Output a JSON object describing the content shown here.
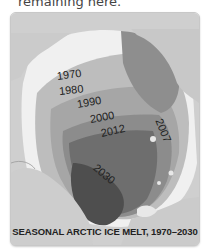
{
  "caption_top": "remaining here.",
  "map": {
    "title": "SEASONAL ARCTIC ICE MELT, 1970–2030",
    "style": "grayscale",
    "labels": [
      {
        "year": "1970",
        "x": 42,
        "y": 72,
        "rotate": -8
      },
      {
        "year": "1980",
        "x": 46,
        "y": 88,
        "rotate": -6
      },
      {
        "year": "1990",
        "x": 66,
        "y": 103,
        "rotate": -10
      },
      {
        "year": "2000",
        "x": 78,
        "y": 118,
        "rotate": -10
      },
      {
        "year": "2012",
        "x": 88,
        "y": 134,
        "rotate": -12
      },
      {
        "year": "2007",
        "x": 148,
        "y": 112,
        "rotate": 68
      },
      {
        "year": "2030",
        "x": 84,
        "y": 162,
        "rotate": 40
      }
    ],
    "colors": {
      "background": "#d6d6d6",
      "land": "#c9c9c9",
      "ice_white": "#f2f2f2",
      "band_1970": "#b8b8b8",
      "band_1990": "#9e9e9e",
      "band_2007": "#8a8a8a",
      "band_2012": "#6f6f6f",
      "band_2030": "#505050"
    }
  }
}
